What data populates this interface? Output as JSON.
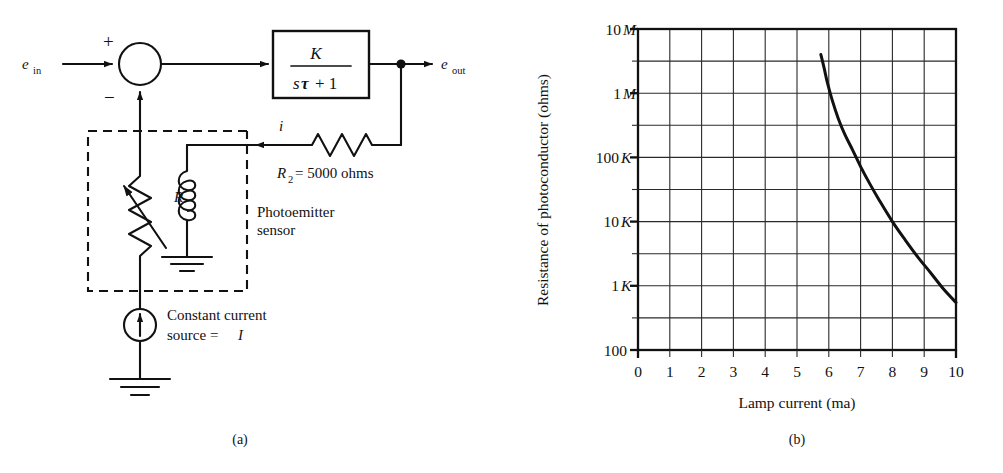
{
  "figure": {
    "panels": [
      {
        "id": "a",
        "caption": "(a)",
        "type": "block-diagram-circuit"
      },
      {
        "id": "b",
        "caption": "(b)",
        "type": "chart"
      }
    ]
  },
  "diagram": {
    "input_label": "e",
    "input_sub": "in",
    "output_label": "e",
    "output_sub": "out",
    "plus_sign": "+",
    "minus_sign": "−",
    "transfer_numerator": "K",
    "transfer_denominator_s": "s",
    "transfer_denominator_tau": "τ",
    "transfer_denominator_rest": "+ 1",
    "current_label": "i",
    "r2_label": "R",
    "r2_sub": "2",
    "r2_value": "= 5000 ohms",
    "resistor_label": "R",
    "sensor_label_line1": "Photoemitter",
    "sensor_label_line2": "sensor",
    "source_label_line1": "Constant current",
    "source_label_line2_pre": "source = ",
    "source_label_line2_sym": "I",
    "icons": [
      "summing-junction-icon",
      "transfer-function-block-icon",
      "variable-resistor-icon",
      "resistor-icon",
      "photoemitter-coil-icon",
      "current-source-icon",
      "ground-icon"
    ]
  },
  "chart_data": {
    "type": "line",
    "title": "",
    "xlabel": "Lamp current (ma)",
    "ylabel": "Resistance of photoconductor (ohms)",
    "xlim": [
      0,
      10
    ],
    "xticks": [
      "0",
      "1",
      "2",
      "3",
      "4",
      "5",
      "6",
      "7",
      "8",
      "9",
      "10"
    ],
    "xtick_values": [
      0,
      1,
      2,
      3,
      4,
      5,
      6,
      7,
      8,
      9,
      10
    ],
    "yscale": "log",
    "ylim": [
      100,
      10000000
    ],
    "yticks": [
      "100",
      "1 K",
      "10 K",
      "100 K",
      "1 M",
      "10 M"
    ],
    "ytick_values": [
      100,
      1000,
      10000,
      100000,
      1000000,
      10000000
    ],
    "ytick_parts": [
      {
        "num": "100",
        "unit": ""
      },
      {
        "num": "1",
        "unit": "K"
      },
      {
        "num": "10",
        "unit": "K"
      },
      {
        "num": "100",
        "unit": "K"
      },
      {
        "num": "1",
        "unit": "M"
      },
      {
        "num": "10",
        "unit": "M"
      }
    ],
    "grid": true,
    "grid_minor_y": "half-decade",
    "legend": "none",
    "series": [
      {
        "name": "Photoconductor resistance vs lamp current",
        "x": [
          5.75,
          5.85,
          5.95,
          6.1,
          6.3,
          6.5,
          6.75,
          7.0,
          7.3,
          7.6,
          8.0,
          8.4,
          8.8,
          9.2,
          9.6,
          10.0
        ],
        "y": [
          4000000,
          2500000,
          1500000,
          800000,
          400000,
          230000,
          130000,
          72000,
          38000,
          21000,
          10000,
          5200,
          2800,
          1600,
          900,
          550
        ]
      }
    ]
  }
}
